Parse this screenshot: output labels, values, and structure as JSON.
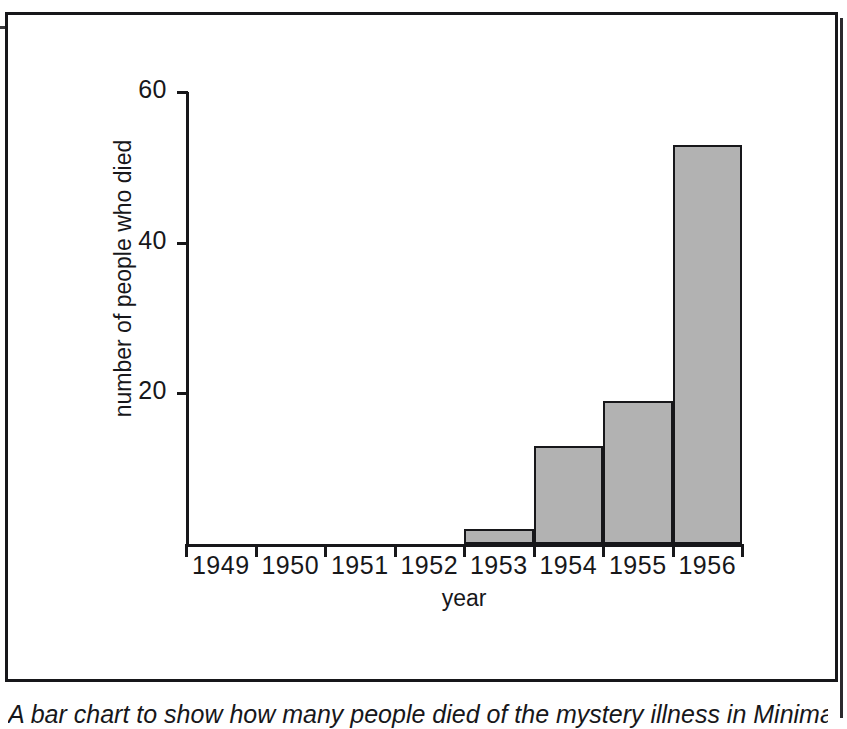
{
  "figure": {
    "caption": "A bar chart to show how many people died of the mystery illness in Minimata"
  },
  "chart_data": {
    "type": "bar",
    "title": "",
    "categories": [
      "1949",
      "1950",
      "1951",
      "1952",
      "1953",
      "1954",
      "1955",
      "1956"
    ],
    "values": [
      0,
      0,
      0,
      0,
      2,
      13,
      19,
      53
    ],
    "xlabel": "year",
    "ylabel": "number of people who died",
    "ylim": [
      0,
      60
    ],
    "y_ticks": [
      20,
      40,
      60
    ],
    "y_tick_labels": [
      "20",
      "40",
      "60"
    ],
    "grid": false,
    "legend": false,
    "bar_fill_color": "#b2b2b2",
    "bar_edge_color": "#17171a",
    "axis_color": "#17171a"
  }
}
